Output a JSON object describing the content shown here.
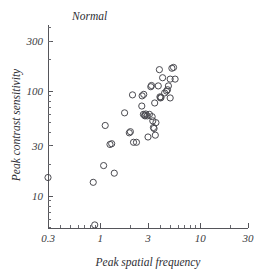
{
  "chart_data": {
    "type": "scatter",
    "title": "Normal",
    "xlabel": "Peak spatial frequency",
    "ylabel": "Peak contrast sensitivity",
    "xscale": "log",
    "yscale": "log",
    "xlim": [
      0.3,
      30
    ],
    "ylim": [
      4.2,
      420
    ],
    "xticks": [
      0.3,
      1,
      3,
      10,
      30
    ],
    "xticklabels": [
      "0.3",
      "1",
      "3",
      "10",
      "30"
    ],
    "yticks": [
      10,
      30,
      100,
      300
    ],
    "yticklabels": [
      "10",
      "30",
      "100",
      "300"
    ],
    "grid": false,
    "legend": null,
    "marker": "open-circle",
    "marker_size_px": 5.0,
    "n_points": 48,
    "series": [
      {
        "name": "Normal observers",
        "points": [
          [
            0.3,
            15.0
          ],
          [
            0.85,
            13.5
          ],
          [
            0.88,
            5.3
          ],
          [
            1.08,
            19.5
          ],
          [
            1.25,
            31.0
          ],
          [
            1.3,
            31.5
          ],
          [
            1.12,
            47.0
          ],
          [
            1.38,
            16.5
          ],
          [
            1.75,
            62.0
          ],
          [
            2.0,
            41.0
          ],
          [
            2.1,
            92.0
          ],
          [
            2.15,
            32.5
          ],
          [
            2.6,
            72.0
          ],
          [
            2.62,
            90.0
          ],
          [
            2.72,
            93.0
          ],
          [
            2.7,
            60.0
          ],
          [
            2.78,
            59.0
          ],
          [
            2.8,
            58.0
          ],
          [
            2.85,
            60.5
          ],
          [
            3.0,
            36.5
          ],
          [
            3.2,
            110.0
          ],
          [
            3.25,
            113.0
          ],
          [
            3.3,
            57.0
          ],
          [
            3.35,
            52.0
          ],
          [
            3.4,
            45.0
          ],
          [
            3.45,
            44.0
          ],
          [
            3.5,
            77.0
          ],
          [
            3.55,
            38.0
          ],
          [
            3.8,
            112.0
          ],
          [
            3.9,
            160.0
          ],
          [
            3.95,
            88.0
          ],
          [
            4.0,
            86.0
          ],
          [
            4.05,
            87.0
          ],
          [
            4.2,
            134.0
          ],
          [
            4.6,
            100.0
          ],
          [
            4.7,
            103.0
          ],
          [
            4.8,
            112.0
          ],
          [
            5.0,
            130.0
          ],
          [
            5.2,
            165.0
          ],
          [
            5.4,
            168.0
          ],
          [
            5.6,
            130.0
          ],
          [
            5.0,
            86.0
          ],
          [
            3.1,
            60.0
          ],
          [
            2.95,
            58.0
          ],
          [
            2.3,
            32.5
          ],
          [
            1.95,
            40.0
          ],
          [
            4.4,
            96.0
          ],
          [
            3.6,
            50.0
          ]
        ]
      }
    ]
  }
}
